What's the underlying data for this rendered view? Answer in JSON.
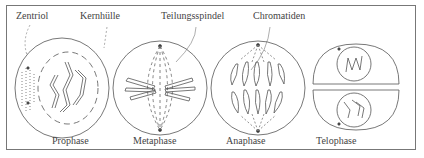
{
  "figure": {
    "top_labels": {
      "centriole": "Zentriol",
      "nuclear_envelope": "Kernhülle",
      "spindle": "Teilungsspindel",
      "chromatids": "Chromatiden"
    },
    "phases": [
      {
        "name": "Prophase"
      },
      {
        "name": "Metaphase"
      },
      {
        "name": "Anaphase"
      },
      {
        "name": "Telophase"
      }
    ],
    "stroke_color": "#555555"
  }
}
